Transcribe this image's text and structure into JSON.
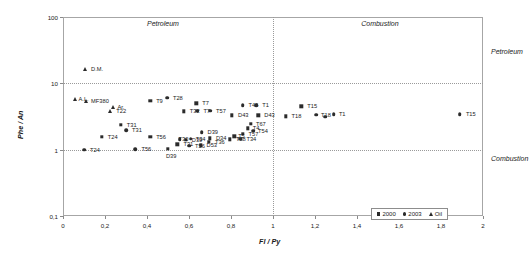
{
  "chart_data": {
    "type": "scatter",
    "title": "",
    "xlabel": "Fl / Py",
    "ylabel": "Phe / An",
    "xlim": [
      0,
      2
    ],
    "ylim": [
      0.1,
      100
    ],
    "yscale": "log",
    "xscale": "linear",
    "grid": true,
    "xticks": [
      "0",
      "0,2",
      "0,4",
      "0,6",
      "0,8",
      "1",
      "1,2",
      "1,4",
      "1,6",
      "1,8",
      "2"
    ],
    "xtick_values": [
      0,
      0.2,
      0.4,
      0.6,
      0.8,
      1,
      1.2,
      1.4,
      1.6,
      1.8,
      2
    ],
    "yticks": [
      "0,1",
      "1",
      "10",
      "100"
    ],
    "ytick_values": [
      0.1,
      1,
      10,
      100
    ],
    "reference_lines": [
      {
        "axis": "x",
        "value": 1,
        "style": "dotted"
      },
      {
        "axis": "y",
        "value": 10,
        "style": "dotted"
      }
    ],
    "annotations": [
      {
        "text": "Petroleum",
        "x": 0.4,
        "y": 78,
        "position": "top-left"
      },
      {
        "text": "Combustion",
        "x": 1.42,
        "y": 78,
        "position": "top-right"
      },
      {
        "text": "Petroleum",
        "x": 2.08,
        "y": 30,
        "position": "right-upper"
      },
      {
        "text": "Combustion",
        "x": 2.08,
        "y": 0.72,
        "position": "right-lower"
      }
    ],
    "legend": {
      "position": "bottom-right",
      "entries": [
        {
          "label": "2000",
          "marker": "square"
        },
        {
          "label": "2003",
          "marker": "circle"
        },
        {
          "label": "Oil",
          "marker": "triangle"
        }
      ]
    },
    "series": [
      {
        "name": "2000",
        "marker": "square",
        "points": [
          {
            "label": "T9",
            "x": 0.415,
            "y": 5.4,
            "lx": 6,
            "ly": 0
          },
          {
            "label": "T7",
            "x": 0.635,
            "y": 5.0,
            "lx": 6,
            "ly": 0
          },
          {
            "label": "T32",
            "x": 0.575,
            "y": 3.8,
            "lx": 6,
            "ly": 0
          },
          {
            "label": "T31",
            "x": 0.275,
            "y": 2.35,
            "lx": 6,
            "ly": 0
          },
          {
            "label": "T24",
            "x": 0.185,
            "y": 1.55,
            "lx": 6,
            "ly": 0
          },
          {
            "label": "T56",
            "x": 0.415,
            "y": 1.55,
            "lx": 6,
            "ly": 0
          },
          {
            "label": "D39",
            "x": 0.585,
            "y": 1.42,
            "lx": 6,
            "ly": 0
          },
          {
            "label": "D53",
            "x": 0.655,
            "y": 1.16,
            "lx": 6,
            "ly": 0
          },
          {
            "label": "T31",
            "x": 0.545,
            "y": 1.2,
            "lx": 6,
            "ly": 0
          },
          {
            "label": "D39",
            "x": 0.5,
            "y": 1.02,
            "lx": -2,
            "ly": 7
          },
          {
            "label": "D43",
            "x": 0.805,
            "y": 3.3,
            "lx": 6,
            "ly": 0
          },
          {
            "label": "D34",
            "x": 0.7,
            "y": 1.48,
            "lx": 6,
            "ly": 0
          },
          {
            "label": "T36",
            "x": 0.695,
            "y": 1.31,
            "lx": 6,
            "ly": 0
          },
          {
            "label": "T28",
            "x": 0.795,
            "y": 1.43,
            "lx": 6,
            "ly": 0
          },
          {
            "label": "T34",
            "x": 0.845,
            "y": 1.47,
            "lx": 6,
            "ly": 0
          },
          {
            "label": "T57",
            "x": 0.855,
            "y": 1.72,
            "lx": 6,
            "ly": 0
          },
          {
            "label": "T5",
            "x": 0.815,
            "y": 1.6,
            "lx": 4,
            "ly": 0
          },
          {
            "label": "T4",
            "x": 0.88,
            "y": 2.1,
            "lx": 5,
            "ly": 0
          },
          {
            "label": "T67",
            "x": 0.895,
            "y": 2.45,
            "lx": 5,
            "ly": 0
          },
          {
            "label": "D43",
            "x": 0.93,
            "y": 3.3,
            "lx": 6,
            "ly": 0
          },
          {
            "label": "T18",
            "x": 1.06,
            "y": 3.2,
            "lx": 6,
            "ly": 0
          },
          {
            "label": "T15",
            "x": 1.135,
            "y": 4.5,
            "lx": 6,
            "ly": 0
          }
        ]
      },
      {
        "name": "2003",
        "marker": "circle",
        "points": [
          {
            "label": "T28",
            "x": 0.495,
            "y": 6.1,
            "lx": 6,
            "ly": 0
          },
          {
            "label": "T7",
            "x": 0.64,
            "y": 3.85,
            "lx": 6,
            "ly": 0
          },
          {
            "label": "T57",
            "x": 0.7,
            "y": 3.85,
            "lx": 6,
            "ly": 0
          },
          {
            "label": "T31",
            "x": 0.3,
            "y": 1.95,
            "lx": 6,
            "ly": 0
          },
          {
            "label": "T24",
            "x": 0.1,
            "y": 1.0,
            "lx": 6,
            "ly": 0
          },
          {
            "label": "T56",
            "x": 0.345,
            "y": 1.02,
            "lx": 6,
            "ly": 0
          },
          {
            "label": "T46",
            "x": 0.855,
            "y": 4.7,
            "lx": 6,
            "ly": 0
          },
          {
            "label": "T1",
            "x": 0.92,
            "y": 4.7,
            "lx": 6,
            "ly": 0
          },
          {
            "label": "D39",
            "x": 0.66,
            "y": 1.85,
            "lx": 6,
            "ly": 0
          },
          {
            "label": "T34",
            "x": 0.608,
            "y": 1.47,
            "lx": 5,
            "ly": 0
          },
          {
            "label": "T30",
            "x": 0.555,
            "y": 1.43,
            "lx": -1,
            "ly": 0
          },
          {
            "label": "T56",
            "x": 0.6,
            "y": 1.14,
            "lx": 6,
            "ly": 0
          },
          {
            "label": "T54",
            "x": 0.905,
            "y": 1.92,
            "lx": 5,
            "ly": 0
          },
          {
            "label": "T15",
            "x": 1.89,
            "y": 3.45,
            "lx": 6,
            "ly": 0
          },
          {
            "label": "T18",
            "x": 1.205,
            "y": 3.35,
            "lx": 5,
            "ly": 0
          },
          {
            "label": "T1",
            "x": 1.29,
            "y": 3.45,
            "lx": 5,
            "ly": 0
          },
          {
            "label": "",
            "x": 1.248,
            "y": 3.15,
            "lx": 0,
            "ly": 0
          }
        ]
      },
      {
        "name": "Oil",
        "marker": "triangle",
        "points": [
          {
            "label": "D.M.",
            "x": 0.105,
            "y": 16.5,
            "lx": 6,
            "ly": 0
          },
          {
            "label": "A.L.",
            "x": 0.055,
            "y": 5.8,
            "lx": 4,
            "ly": 0
          },
          {
            "label": "MF380",
            "x": 0.11,
            "y": 5.4,
            "lx": 5,
            "ly": 0
          },
          {
            "label": "Ar.",
            "x": 0.24,
            "y": 4.4,
            "lx": 4,
            "ly": 0
          },
          {
            "label": "T22",
            "x": 0.225,
            "y": 3.85,
            "lx": 6,
            "ly": 0
          }
        ]
      }
    ]
  }
}
